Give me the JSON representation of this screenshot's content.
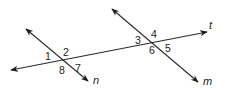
{
  "diagram": {
    "type": "transversal-angles",
    "colors": {
      "line": "#2a2a2a",
      "text": "#222222",
      "background": "#ffffff"
    },
    "lines": [
      {
        "id": "t",
        "label": "t",
        "x1": 11,
        "y1": 70,
        "x2": 207,
        "y2": 32,
        "label_x": 209,
        "label_y": 29,
        "arrows": "both"
      },
      {
        "id": "n",
        "label": "n",
        "x1": 26,
        "y1": 29,
        "x2": 88,
        "y2": 81,
        "label_x": 93,
        "label_y": 84,
        "arrows": "both"
      },
      {
        "id": "m",
        "label": "m",
        "x1": 112,
        "y1": 9,
        "x2": 198,
        "y2": 82,
        "label_x": 203,
        "label_y": 85,
        "arrows": "both"
      }
    ],
    "intersections": [
      {
        "lines": [
          "n",
          "t"
        ],
        "x": 62,
        "y": 60
      },
      {
        "lines": [
          "m",
          "t"
        ],
        "x": 153,
        "y": 43
      }
    ],
    "angle_labels": [
      {
        "label": "1",
        "x": 45,
        "y": 60
      },
      {
        "label": "2",
        "x": 63,
        "y": 56
      },
      {
        "label": "8",
        "x": 59,
        "y": 74
      },
      {
        "label": "7",
        "x": 75,
        "y": 72
      },
      {
        "label": "3",
        "x": 135,
        "y": 44
      },
      {
        "label": "4",
        "x": 151,
        "y": 38
      },
      {
        "label": "6",
        "x": 149,
        "y": 54
      },
      {
        "label": "5",
        "x": 165,
        "y": 52
      }
    ]
  }
}
